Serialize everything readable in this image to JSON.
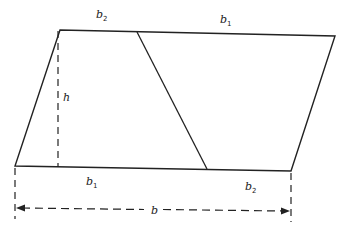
{
  "diagram": {
    "stroke_color": "#222222",
    "background": "#ffffff",
    "vertices": {
      "top_left": [
        60,
        30
      ],
      "top_right": [
        335,
        36
      ],
      "bottom_left": [
        15,
        166
      ],
      "bottom_right": [
        291,
        171
      ],
      "divider_top": [
        137,
        32
      ],
      "divider_bottom": [
        207,
        169
      ]
    },
    "labels": {
      "top_b2": {
        "base": "b",
        "sub": "2",
        "x": 96,
        "y": 18
      },
      "top_b1": {
        "base": "b",
        "sub": "1",
        "x": 220,
        "y": 23
      },
      "height": {
        "base": "h",
        "x": 63,
        "y": 101
      },
      "bottom_b1": {
        "base": "b",
        "sub": "1",
        "x": 86,
        "y": 185
      },
      "bottom_b2": {
        "base": "b",
        "sub": "2",
        "x": 245,
        "y": 190
      },
      "total_b": {
        "base": "b",
        "x": 151,
        "y": 214
      }
    }
  }
}
